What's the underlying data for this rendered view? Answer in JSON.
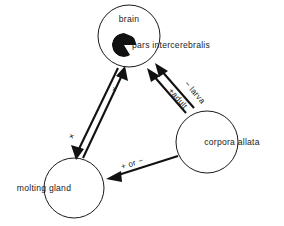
{
  "figure": {
    "background_color": "#ffffff",
    "ink_color": "#111111",
    "nodes": [
      {
        "id": "brain",
        "label": "brain",
        "cx": 129,
        "cy": 36,
        "r": 31,
        "label_x": 129,
        "label_y": 22
      },
      {
        "id": "pars_intercerebralis",
        "label": "pars intercerebralis",
        "cx": 124,
        "cy": 45,
        "r": 12,
        "label_x": 140,
        "label_y": 48,
        "filled": true
      },
      {
        "id": "molting_gland",
        "label": "molting gland",
        "cx": 74,
        "cy": 188,
        "r": 30,
        "label_x": 44,
        "label_y": 191
      },
      {
        "id": "corpora_allata",
        "label": "corpora allata",
        "cx": 207,
        "cy": 142,
        "r": 31,
        "label_x": 232,
        "label_y": 145
      }
    ],
    "edges": [
      {
        "id": "pars-to-molting-gland",
        "from": "pars_intercerebralis",
        "to": "molting_gland",
        "sign": "+",
        "label_x": 73,
        "label_y": 136
      },
      {
        "id": "molting-gland-to-pars",
        "from": "molting_gland",
        "to": "pars_intercerebralis",
        "sign": "+",
        "label_x": 114,
        "label_y": 89
      },
      {
        "id": "corpora-allata-to-pars-larva",
        "from": "corpora_allata",
        "to": "pars_intercerebralis",
        "label": "− larva",
        "label_x": 183,
        "label_y": 86
      },
      {
        "id": "corpora-allata-to-pars-adult",
        "from": "corpora_allata",
        "to": "pars_intercerebralis",
        "label": "+adult",
        "label_x": 168,
        "label_y": 95
      },
      {
        "id": "corpora-allata-to-molting-gland",
        "from": "corpora_allata",
        "to": "molting_gland",
        "label": "+ or −",
        "label_x": 133,
        "label_y": 165
      }
    ]
  }
}
